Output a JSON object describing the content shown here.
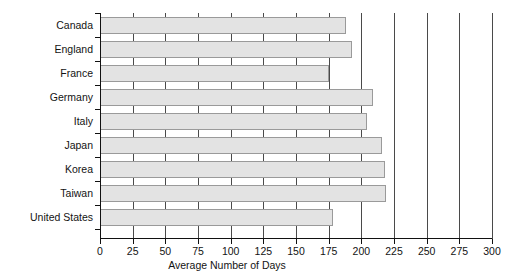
{
  "chart_data": {
    "type": "bar",
    "orientation": "horizontal",
    "title": "",
    "xlabel": "Average Number of Days",
    "ylabel": "",
    "xlim": [
      0,
      300
    ],
    "xticks": [
      0,
      25,
      50,
      75,
      100,
      125,
      150,
      175,
      200,
      225,
      250,
      275,
      300
    ],
    "xtick_labels": [
      "0",
      "25",
      "50",
      "75",
      "100",
      "125",
      "150",
      "175",
      "200",
      "225",
      "250",
      "275",
      "300"
    ],
    "grid": true,
    "grid_axis": "x",
    "legend": null,
    "categories": [
      "Canada",
      "England",
      "France",
      "Germany",
      "Italy",
      "Japan",
      "Korea",
      "Taiwan",
      "United States"
    ],
    "values": [
      188,
      193,
      175,
      209,
      204,
      216,
      218,
      219,
      178
    ],
    "bar_fill_color": "#e3e3e3",
    "bar_edge_color": "#9a9a9a",
    "grid_color": "#4a4a4a",
    "axis_color": "#111111",
    "background_color": "#ffffff"
  }
}
